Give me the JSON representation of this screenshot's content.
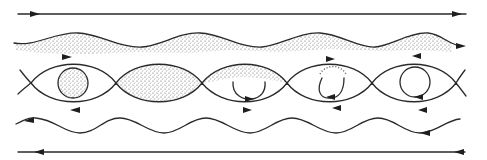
{
  "diagram": {
    "colors": {
      "ink": "#2a2a2a",
      "background": "#ffffff",
      "stipple": "#555555"
    },
    "top_stream": {
      "y": 14,
      "x_start": 18,
      "x_end": 466,
      "direction": "right"
    },
    "upper_wave": {
      "base_y": 41,
      "amplitude": 7,
      "period": 86,
      "x_start": 14,
      "x_end": 462,
      "direction": "right",
      "shaded_side": "below"
    },
    "cats_eye_row": {
      "center_y": 83,
      "half_height": 27,
      "crossings_x": [
        31,
        116,
        202,
        287,
        372,
        456
      ],
      "cells": [
        {
          "index": 0,
          "content": "shaded-circle",
          "arrows": [
            "top-right",
            "bottom-left"
          ]
        },
        {
          "index": 1,
          "content": "fully-shaded-eye",
          "arrows": []
        },
        {
          "index": 2,
          "content": "partially-shaded-with-arc",
          "arrows": [
            "arc-right"
          ]
        },
        {
          "index": 3,
          "content": "open-arc-with-dots",
          "arrows": [
            "top-right",
            "bottom-left",
            "arc-left"
          ]
        },
        {
          "index": 4,
          "content": "closed-circle",
          "arrows": [
            "top-left",
            "bottom-left",
            "circle-ccw"
          ]
        }
      ]
    },
    "lower_wave": {
      "base_y": 126,
      "amplitude": 7,
      "period": 86,
      "x_start": 16,
      "x_end": 460,
      "direction": "left"
    },
    "bottom_stream": {
      "y": 152,
      "x_start": 18,
      "x_end": 465,
      "direction": "left"
    }
  }
}
